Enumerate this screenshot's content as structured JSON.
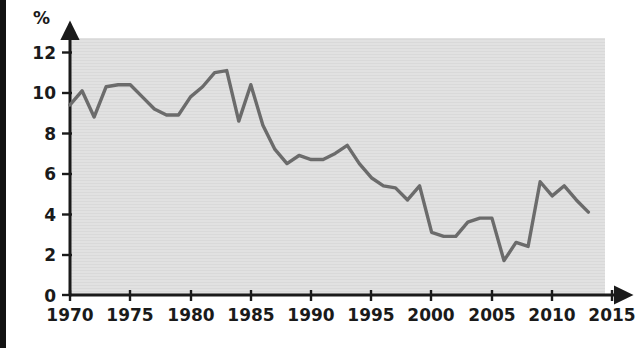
{
  "chart_data": {
    "type": "line",
    "title": "",
    "subtitle": "",
    "xlabel": "",
    "ylabel": "%",
    "ylabel_position": "top-left",
    "xlim": [
      1970,
      2015
    ],
    "ylim": [
      0,
      13
    ],
    "grid": false,
    "legend": null,
    "legend_position": "none",
    "yticks": [
      0,
      2,
      4,
      6,
      8,
      10,
      12
    ],
    "ytick_labels": [
      "0",
      "2",
      "4",
      "6",
      "8",
      "10",
      "12"
    ],
    "xticks": [
      1970,
      1975,
      1980,
      1985,
      1990,
      1995,
      2000,
      2005,
      2010,
      2015
    ],
    "xtick_labels": [
      "1970",
      "1975",
      "1980",
      "1985",
      "1990",
      "1995",
      "2000",
      "2005",
      "2010",
      "2015"
    ],
    "axis_arrows": {
      "x": true,
      "y": true
    },
    "plot_background": "#e0e0e0",
    "line_color": "#6b6b6b",
    "line_width": 3.4,
    "axis_color": "#1a1a1a",
    "series": [
      {
        "name": "value",
        "x": [
          1970,
          1971,
          1972,
          1973,
          1974,
          1975,
          1976,
          1977,
          1978,
          1979,
          1980,
          1981,
          1982,
          1983,
          1984,
          1985,
          1986,
          1987,
          1988,
          1989,
          1990,
          1991,
          1992,
          1993,
          1994,
          1995,
          1996,
          1997,
          1998,
          1999,
          2000,
          2001,
          2002,
          2003,
          2004,
          2005,
          2006,
          2007,
          2008,
          2009,
          2010,
          2011,
          2012,
          2013
        ],
        "values": [
          9.4,
          10.1,
          8.8,
          10.3,
          10.4,
          10.4,
          9.8,
          9.2,
          8.9,
          8.9,
          9.8,
          10.3,
          11.0,
          11.1,
          8.6,
          10.4,
          8.4,
          7.2,
          6.5,
          6.9,
          6.7,
          6.7,
          7.0,
          7.4,
          6.5,
          5.8,
          5.4,
          5.3,
          4.7,
          5.4,
          3.1,
          2.9,
          2.9,
          3.6,
          3.8,
          3.8,
          1.7,
          2.6,
          2.4,
          5.6,
          4.9,
          5.4,
          4.7,
          4.1
        ]
      }
    ]
  },
  "axis": {
    "y_unit_label": "%"
  }
}
